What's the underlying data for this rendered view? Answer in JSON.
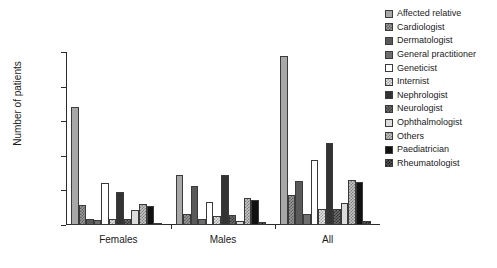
{
  "chart_data": {
    "type": "bar",
    "title": "",
    "xlabel": "",
    "ylabel": "Number of patients",
    "ylim": [
      0,
      200
    ],
    "yticks": [
      0,
      40,
      80,
      120,
      160,
      200
    ],
    "grid": false,
    "legend_position": "right",
    "categories": [
      "Females",
      "Males",
      "All"
    ],
    "series": [
      {
        "name": "Affected relative",
        "swatch": "solid-light-grey",
        "values": [
          137,
          58,
          195
        ]
      },
      {
        "name": "Cardiologist",
        "swatch": "checked-grey",
        "values": [
          23,
          13,
          35
        ]
      },
      {
        "name": "Dermatologist",
        "swatch": "solid-dark-grey",
        "values": [
          7,
          45,
          51
        ]
      },
      {
        "name": "General practitioner",
        "swatch": "solid-mid-grey",
        "values": [
          6,
          7,
          13
        ]
      },
      {
        "name": "Geneticist",
        "swatch": "white",
        "values": [
          49,
          27,
          75
        ]
      },
      {
        "name": "Internist",
        "swatch": "checked-light",
        "values": [
          7,
          10,
          18
        ]
      },
      {
        "name": "Nephrologist",
        "swatch": "solid-near-black",
        "values": [
          38,
          58,
          95
        ]
      },
      {
        "name": "Neurologist",
        "swatch": "checked-dark",
        "values": [
          7,
          12,
          18
        ]
      },
      {
        "name": "Ophthalmologist",
        "swatch": "solid-palest-grey",
        "values": [
          17,
          5,
          25
        ]
      },
      {
        "name": "Others",
        "swatch": "checked-mid",
        "values": [
          24,
          31,
          52
        ]
      },
      {
        "name": "Paediatrician",
        "swatch": "solid-black",
        "values": [
          22,
          29,
          50
        ]
      },
      {
        "name": "Rheumatologist",
        "swatch": "checked-black",
        "values": [
          1,
          3,
          5
        ]
      }
    ]
  },
  "axis": {
    "y_title": "Number of patients",
    "y_tick_labels": [
      "0",
      "40",
      "80",
      "120",
      "160",
      "200"
    ],
    "x_tick_labels": [
      "Females",
      "Males",
      "All"
    ]
  }
}
